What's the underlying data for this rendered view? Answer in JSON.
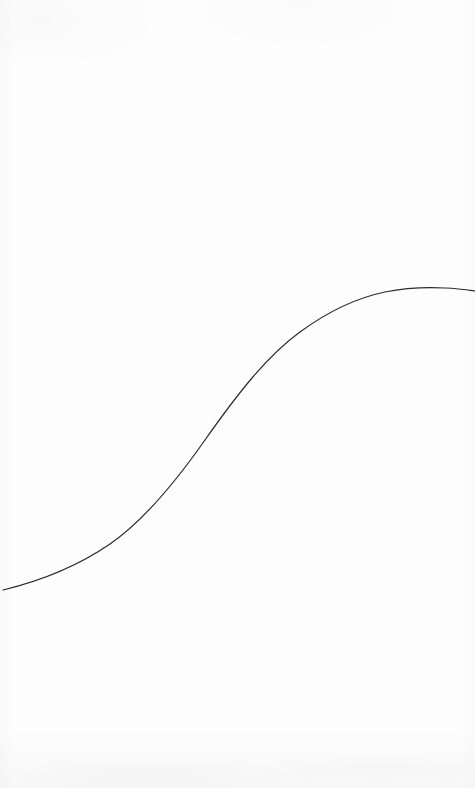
{
  "canvas": {
    "width": 475,
    "height": 788,
    "background_color": "#fdfdfd",
    "paper_texture": true
  },
  "chart_data": {
    "type": "line",
    "title": "",
    "subtitle": "",
    "xlabel": "",
    "ylabel": "",
    "legend": [],
    "legend_position": "none",
    "grid": false,
    "axes_visible": false,
    "tick_labels_x": [],
    "tick_labels_y": [],
    "annotations": [],
    "line_color": "#2b2b30",
    "line_width": 1.2,
    "xlim": [
      0,
      475
    ],
    "ylim": [
      788,
      0
    ],
    "x": [
      3,
      30,
      60,
      100,
      150,
      180,
      205,
      230,
      250,
      275,
      300,
      325,
      350,
      380,
      400,
      420,
      445,
      475
    ],
    "y": [
      590,
      583,
      573,
      552,
      500,
      470,
      440,
      408,
      380,
      355,
      332,
      316,
      303,
      294,
      290,
      288,
      288,
      291
    ],
    "series": [
      {
        "name": "curve",
        "points": [
          [
            3,
            590
          ],
          [
            30,
            583
          ],
          [
            60,
            573
          ],
          [
            100,
            552
          ],
          [
            150,
            500
          ],
          [
            180,
            470
          ],
          [
            205,
            440
          ],
          [
            230,
            408
          ],
          [
            250,
            380
          ],
          [
            275,
            355
          ],
          [
            300,
            332
          ],
          [
            325,
            316
          ],
          [
            350,
            303
          ],
          [
            380,
            294
          ],
          [
            400,
            290
          ],
          [
            420,
            288
          ],
          [
            445,
            288
          ],
          [
            475,
            291
          ]
        ]
      }
    ],
    "path_d": "M 3 590 C 40 581, 78 566, 110 544 C 142 522, 172 487, 205 440 C 238 393, 268 355, 300 332 C 330 310, 356 298, 385 292 C 405 288, 425 287, 445 288 C 458 288.5, 468 290, 475 291"
  }
}
